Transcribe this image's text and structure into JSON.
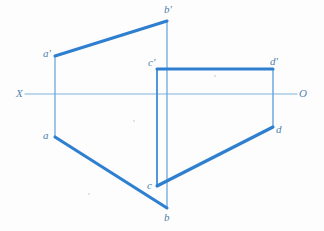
{
  "figure": {
    "width": 324,
    "height": 231,
    "background_color": "#fdfdfd"
  },
  "colors": {
    "thick_stroke": "#2e7fd0",
    "thin_stroke": "#6ca8dc",
    "ground_line": "#a8cce8",
    "label_text": "#4d7fae",
    "axis_label_text": "#5585b2"
  },
  "ground_line": {
    "name": "X-O ground line",
    "left_label": "X",
    "right_label": "O",
    "y": 94,
    "x_start": 25,
    "x_end": 297,
    "left_label_pos": [
      16,
      88
    ],
    "right_label_pos": [
      299,
      88
    ]
  },
  "points": [
    {
      "id": "a-prime",
      "label": "a'",
      "x": 55,
      "y": 56,
      "label_pos": [
        43,
        48
      ],
      "view": "frontal"
    },
    {
      "id": "b-prime",
      "label": "b'",
      "x": 167,
      "y": 21,
      "label_pos": [
        164,
        4
      ],
      "view": "frontal"
    },
    {
      "id": "c-prime",
      "label": "c'",
      "x": 157,
      "y": 69,
      "label_pos": [
        148,
        57
      ],
      "view": "frontal"
    },
    {
      "id": "d-prime",
      "label": "d'",
      "x": 273,
      "y": 69,
      "label_pos": [
        270,
        56
      ],
      "view": "frontal"
    },
    {
      "id": "a",
      "label": "a",
      "x": 55,
      "y": 137,
      "label_pos": [
        43,
        130
      ],
      "view": "horizontal"
    },
    {
      "id": "b",
      "label": "b",
      "x": 167,
      "y": 208,
      "label_pos": [
        164,
        212
      ],
      "view": "horizontal"
    },
    {
      "id": "c",
      "label": "c",
      "x": 157,
      "y": 186,
      "label_pos": [
        147,
        180
      ],
      "view": "horizontal"
    },
    {
      "id": "d",
      "label": "d",
      "x": 273,
      "y": 127,
      "label_pos": [
        276,
        124
      ],
      "view": "horizontal"
    }
  ],
  "segments": [
    {
      "id": "seg-ab-prime",
      "name": "frontal projection of AB",
      "from": "a-prime",
      "to": "b-prime",
      "weight": "thick"
    },
    {
      "id": "seg-cd-prime",
      "name": "frontal projection of CD",
      "from": "c-prime",
      "to": "d-prime",
      "weight": "thick"
    },
    {
      "id": "seg-ab",
      "name": "horizontal projection of AB",
      "from": "a",
      "to": "b",
      "weight": "thick"
    },
    {
      "id": "seg-cd",
      "name": "horizontal projection of CD",
      "from": "c",
      "to": "d",
      "weight": "thick"
    }
  ],
  "projectors": [
    {
      "id": "proj-a",
      "name": "projector a'-a",
      "x": 55,
      "y_top": 56,
      "y_bottom": 137,
      "weight": "thin"
    },
    {
      "id": "proj-b",
      "name": "projector b'-b",
      "x": 167,
      "y_top": 21,
      "y_bottom": 208,
      "weight": "thin"
    },
    {
      "id": "proj-c",
      "name": "projector c'-c",
      "x": 157,
      "y_top": 69,
      "y_bottom": 186,
      "weight": "medium"
    },
    {
      "id": "proj-d",
      "name": "projector d'-d",
      "x": 273,
      "y_top": 69,
      "y_bottom": 127,
      "weight": "thin"
    }
  ],
  "specks": [
    {
      "x": 133,
      "y": 120
    },
    {
      "x": 214,
      "y": 75
    },
    {
      "x": 88,
      "y": 193
    }
  ]
}
